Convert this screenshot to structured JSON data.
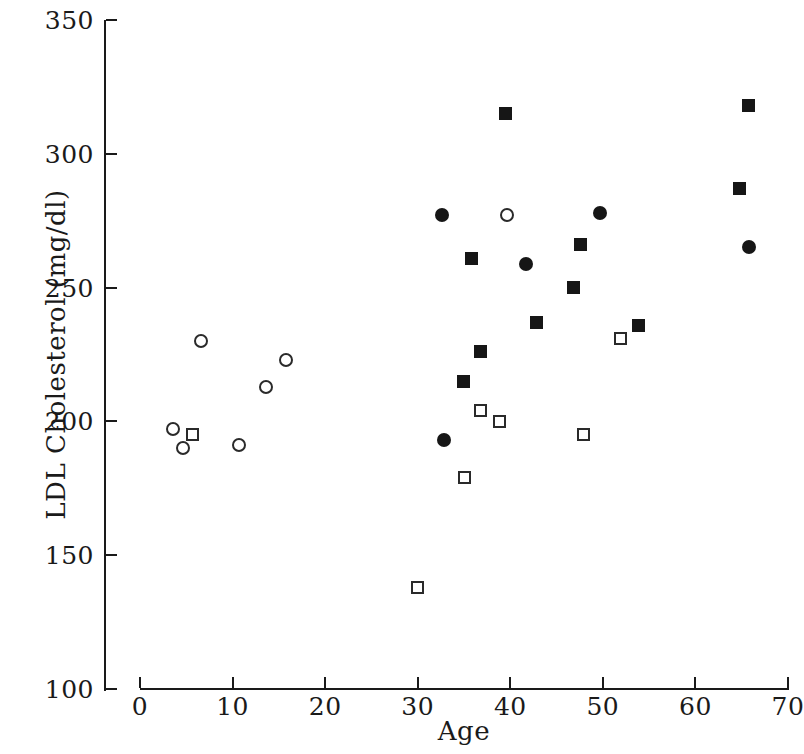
{
  "chart_data": {
    "type": "scatter",
    "title": "",
    "xlabel": "Age",
    "ylabel": "LDL Cholesterol (mg/dl)",
    "xlim": [
      0,
      70
    ],
    "ylim": [
      100,
      350
    ],
    "xticks": [
      0,
      10,
      20,
      30,
      40,
      50,
      60,
      70
    ],
    "xtick_labels": [
      "0",
      "10",
      "20",
      "30",
      "40",
      "50",
      "60",
      "70"
    ],
    "yticks": [
      100,
      150,
      200,
      250,
      300,
      350
    ],
    "ytick_labels": [
      "100",
      "150",
      "200",
      "250",
      "300",
      "350"
    ],
    "grid": false,
    "legend": null,
    "marker_color": "#161616",
    "axis_color": "#1a1a1a",
    "background": "#ffffff",
    "series": [
      {
        "name": "open-circle",
        "marker": "open-circle",
        "points": [
          {
            "x": 3.6,
            "y": 197
          },
          {
            "x": 4.6,
            "y": 190
          },
          {
            "x": 6.6,
            "y": 230
          },
          {
            "x": 10.7,
            "y": 191
          },
          {
            "x": 13.6,
            "y": 213
          },
          {
            "x": 15.8,
            "y": 223
          },
          {
            "x": 39.6,
            "y": 277
          }
        ]
      },
      {
        "name": "open-square",
        "marker": "open-square",
        "points": [
          {
            "x": 5.7,
            "y": 195
          },
          {
            "x": 30.0,
            "y": 138
          },
          {
            "x": 35.0,
            "y": 179
          },
          {
            "x": 36.8,
            "y": 204
          },
          {
            "x": 38.8,
            "y": 200
          },
          {
            "x": 47.9,
            "y": 195
          },
          {
            "x": 51.9,
            "y": 231
          }
        ]
      },
      {
        "name": "filled-circle",
        "marker": "filled-circle",
        "points": [
          {
            "x": 32.8,
            "y": 193
          },
          {
            "x": 32.6,
            "y": 277
          },
          {
            "x": 41.7,
            "y": 259
          },
          {
            "x": 49.7,
            "y": 278
          },
          {
            "x": 65.8,
            "y": 265
          }
        ]
      },
      {
        "name": "filled-square",
        "marker": "filled-square",
        "points": [
          {
            "x": 34.9,
            "y": 215
          },
          {
            "x": 35.8,
            "y": 261
          },
          {
            "x": 36.8,
            "y": 226
          },
          {
            "x": 39.5,
            "y": 315
          },
          {
            "x": 42.8,
            "y": 237
          },
          {
            "x": 46.8,
            "y": 250
          },
          {
            "x": 47.6,
            "y": 266
          },
          {
            "x": 53.9,
            "y": 236
          },
          {
            "x": 64.8,
            "y": 287
          },
          {
            "x": 65.7,
            "y": 318
          }
        ]
      }
    ]
  }
}
